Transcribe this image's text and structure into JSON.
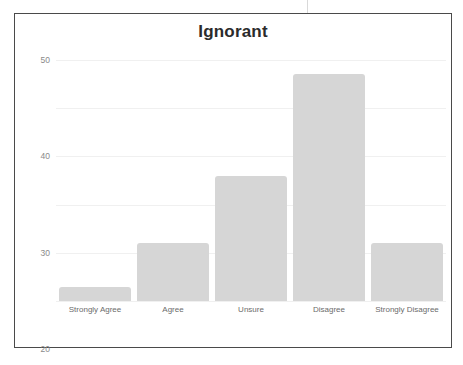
{
  "figure": {
    "border_color": "#4a4a4a",
    "background": "#ffffff"
  },
  "chart_data": {
    "type": "bar",
    "title": "Ignorant",
    "xlabel": "",
    "ylabel": "",
    "categories": [
      "Strongly Agree",
      "Agree",
      "Unsure",
      "Disagree",
      "Strongly Disagree"
    ],
    "values": [
      3,
      12,
      26,
      47,
      12
    ],
    "ylim": [
      0,
      50
    ],
    "yticks": [
      0,
      10,
      20,
      30,
      40,
      50
    ],
    "ytick_labels": [
      "0",
      "10",
      "20",
      "30",
      "40",
      "50"
    ],
    "grid": true,
    "grid_axis": "y",
    "grid_color": "#f0f0f0",
    "legend": false,
    "bar_color": "#d6d6d6",
    "title_color": "#2b2b2b",
    "tick_color": "#8a8a8a",
    "label_color": "#6b6b6b"
  }
}
